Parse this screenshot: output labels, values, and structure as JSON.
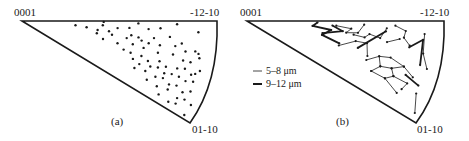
{
  "figure": {
    "panels": [
      {
        "id": "a",
        "caption": "(a)",
        "vertex_labels": {
          "top_left": "0001",
          "top_right": "-12-10",
          "bottom": "01-10"
        },
        "content": "scattered points"
      },
      {
        "id": "b",
        "caption": "(b)",
        "vertex_labels": {
          "top_left": "0001",
          "top_right": "-12-10",
          "bottom": "01-10"
        },
        "content": "connected segments",
        "legend": [
          {
            "label": "5–8 μm",
            "style": "thin"
          },
          {
            "label": "9–12 μm",
            "style": "thick"
          }
        ]
      }
    ]
  },
  "chart_data": [
    {
      "type": "scatter",
      "title": "(a)",
      "corners": [
        "0001",
        "-12-10",
        "01-10"
      ],
      "points": [
        [
          0.42,
          0.02
        ],
        [
          0.6,
          0.04
        ],
        [
          0.8,
          0.04
        ],
        [
          0.42,
          0.1
        ],
        [
          0.28,
          0.15
        ],
        [
          0.5,
          0.14
        ],
        [
          0.56,
          0.12
        ],
        [
          0.66,
          0.12
        ],
        [
          0.72,
          0.1
        ],
        [
          0.92,
          0.12
        ],
        [
          0.34,
          0.18
        ],
        [
          0.4,
          0.22
        ],
        [
          0.46,
          0.22
        ],
        [
          0.58,
          0.24
        ],
        [
          0.62,
          0.26
        ],
        [
          0.7,
          0.24
        ],
        [
          0.78,
          0.2
        ],
        [
          0.85,
          0.26
        ],
        [
          0.93,
          0.32
        ],
        [
          0.95,
          0.34
        ],
        [
          0.4,
          0.3
        ],
        [
          0.48,
          0.28
        ],
        [
          0.56,
          0.3
        ],
        [
          0.64,
          0.3
        ],
        [
          0.68,
          0.32
        ],
        [
          0.74,
          0.32
        ],
        [
          0.82,
          0.3
        ],
        [
          0.88,
          0.34
        ],
        [
          0.96,
          0.38
        ],
        [
          0.44,
          0.4
        ],
        [
          0.52,
          0.42
        ],
        [
          0.6,
          0.38
        ],
        [
          0.66,
          0.4
        ],
        [
          0.74,
          0.42
        ],
        [
          0.82,
          0.4
        ],
        [
          0.88,
          0.44
        ],
        [
          0.92,
          0.44
        ],
        [
          0.98,
          0.5
        ],
        [
          0.56,
          0.5
        ],
        [
          0.6,
          0.52
        ],
        [
          0.66,
          0.52
        ],
        [
          0.7,
          0.56
        ],
        [
          0.76,
          0.52
        ],
        [
          0.8,
          0.56
        ],
        [
          0.86,
          0.54
        ],
        [
          0.9,
          0.52
        ],
        [
          0.94,
          0.56
        ],
        [
          0.96,
          0.54
        ],
        [
          0.62,
          0.6
        ],
        [
          0.66,
          0.64
        ],
        [
          0.72,
          0.62
        ],
        [
          0.76,
          0.6
        ],
        [
          0.8,
          0.64
        ],
        [
          0.84,
          0.62
        ],
        [
          0.88,
          0.62
        ],
        [
          0.92,
          0.64
        ],
        [
          0.96,
          0.62
        ],
        [
          0.64,
          0.72
        ],
        [
          0.7,
          0.7
        ],
        [
          0.76,
          0.72
        ],
        [
          0.8,
          0.7
        ],
        [
          0.84,
          0.74
        ],
        [
          0.88,
          0.72
        ],
        [
          0.92,
          0.76
        ],
        [
          0.96,
          0.72
        ],
        [
          0.72,
          0.8
        ],
        [
          0.78,
          0.82
        ],
        [
          0.84,
          0.8
        ],
        [
          0.9,
          0.84
        ],
        [
          0.94,
          0.82
        ],
        [
          0.98,
          0.84
        ],
        [
          0.8,
          0.9
        ],
        [
          0.86,
          0.92
        ],
        [
          0.9,
          0.9
        ],
        [
          0.96,
          0.96
        ]
      ]
    },
    {
      "type": "line",
      "title": "(b)",
      "corners": [
        "0001",
        "-12-10",
        "01-10"
      ],
      "legend": [
        "5–8 μm",
        "9–12 μm"
      ],
      "segments_thick": [
        [
          [
            0.36,
            0.04
          ],
          [
            0.34,
            0.14
          ],
          [
            0.44,
            0.2
          ],
          [
            0.4,
            0.34
          ],
          [
            0.5,
            0.44
          ]
        ],
        [
          [
            0.4,
            0.3
          ],
          [
            0.5,
            0.2
          ],
          [
            0.44,
            0.1
          ]
        ],
        [
          [
            0.72,
            0.14
          ],
          [
            0.6,
            0.44
          ]
        ],
        [
          [
            0.86,
            0.3
          ],
          [
            0.92,
            0.2
          ],
          [
            0.94,
            0.46
          ]
        ],
        [
          [
            0.88,
            0.6
          ],
          [
            0.96,
            0.66
          ]
        ]
      ],
      "segments_thin": [
        [
          [
            0.46,
            0.1
          ],
          [
            0.54,
            0.14
          ],
          [
            0.52,
            0.22
          ],
          [
            0.58,
            0.2
          ],
          [
            0.6,
            0.06
          ]
        ],
        [
          [
            0.56,
            0.24
          ],
          [
            0.62,
            0.26
          ],
          [
            0.64,
            0.2
          ],
          [
            0.7,
            0.24
          ],
          [
            0.72,
            0.1
          ]
        ],
        [
          [
            0.5,
            0.48
          ],
          [
            0.58,
            0.34
          ],
          [
            0.64,
            0.34
          ],
          [
            0.66,
            0.52
          ]
        ],
        [
          [
            0.76,
            0.06
          ],
          [
            0.82,
            0.12
          ],
          [
            0.82,
            0.2
          ],
          [
            0.86,
            0.28
          ]
        ],
        [
          [
            0.74,
            0.28
          ],
          [
            0.8,
            0.22
          ]
        ],
        [
          [
            0.92,
            0.14
          ],
          [
            0.94,
            0.34
          ],
          [
            0.98,
            0.48
          ]
        ],
        [
          [
            0.66,
            0.58
          ],
          [
            0.72,
            0.48
          ],
          [
            0.78,
            0.46
          ],
          [
            0.86,
            0.52
          ],
          [
            0.92,
            0.6
          ]
        ],
        [
          [
            0.72,
            0.48
          ],
          [
            0.74,
            0.6
          ],
          [
            0.7,
            0.7
          ]
        ],
        [
          [
            0.74,
            0.6
          ],
          [
            0.8,
            0.58
          ],
          [
            0.82,
            0.66
          ],
          [
            0.78,
            0.72
          ]
        ],
        [
          [
            0.8,
            0.58
          ],
          [
            0.86,
            0.52
          ]
        ],
        [
          [
            0.82,
            0.66
          ],
          [
            0.9,
            0.68
          ],
          [
            0.88,
            0.76
          ]
        ],
        [
          [
            0.7,
            0.7
          ],
          [
            0.78,
            0.72
          ],
          [
            0.86,
            0.82
          ]
        ],
        [
          [
            0.96,
            0.74
          ],
          [
            0.98,
            0.92
          ]
        ]
      ]
    }
  ]
}
